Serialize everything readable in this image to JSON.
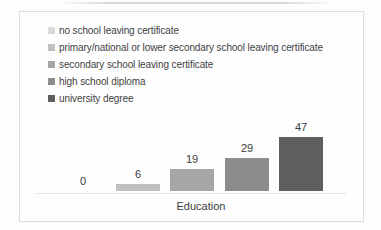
{
  "chart_data": {
    "type": "bar",
    "title": "",
    "xlabel": "Education",
    "categories": [
      "no school leaving certificate",
      "primary/national or lower secondary school leaving certificate",
      "secondary school leaving certificate",
      "high school diploma",
      "university degree"
    ],
    "values": [
      0,
      6,
      19,
      29,
      47
    ],
    "colors": [
      "#d9d9d9",
      "#bfbfbf",
      "#a6a6a6",
      "#8c8c8c",
      "#5e5e5e"
    ],
    "ylim": [
      0,
      50
    ],
    "grid": false,
    "legend_position": "top-left",
    "axis_color": "#e4e4e2",
    "text_color": "#3a3a3a"
  }
}
